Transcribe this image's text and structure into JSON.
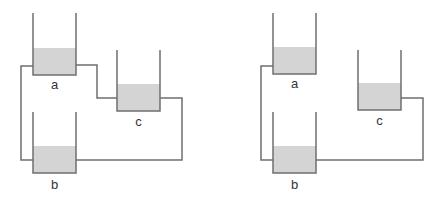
{
  "colors": {
    "line": "#6f6f6f",
    "liquid": "#d4d4d4",
    "label": "#333333",
    "background": "#ffffff"
  },
  "diagrams": [
    {
      "id": "left",
      "description": "Three containers a, b, c all interconnected by pipes",
      "containers": [
        {
          "label": "a",
          "x": 33,
          "top": 13,
          "bottom": 75,
          "width": 43,
          "fill_level": 48
        },
        {
          "label": "c",
          "x": 117,
          "top": 50,
          "bottom": 111,
          "width": 43,
          "fill_level": 84
        },
        {
          "label": "b",
          "x": 33,
          "top": 112,
          "bottom": 173,
          "width": 43,
          "fill_level": 146
        }
      ],
      "pipes": [
        {
          "from": "a",
          "to": "b"
        },
        {
          "from": "a",
          "to": "c"
        },
        {
          "from": "c",
          "to": "b"
        }
      ]
    },
    {
      "id": "right",
      "description": "Three containers a, b, c; a and c each connected to b only",
      "containers": [
        {
          "label": "a",
          "x": 273,
          "top": 13,
          "bottom": 74,
          "width": 43,
          "fill_level": 47
        },
        {
          "label": "c",
          "x": 358,
          "top": 50,
          "bottom": 110,
          "width": 43,
          "fill_level": 83
        },
        {
          "label": "b",
          "x": 273,
          "top": 112,
          "bottom": 173,
          "width": 43,
          "fill_level": 146
        }
      ],
      "pipes": [
        {
          "from": "a",
          "to": "b"
        },
        {
          "from": "c",
          "to": "b"
        }
      ]
    }
  ],
  "labels": {
    "left_a": "a",
    "left_b": "b",
    "left_c": "c",
    "right_a": "a",
    "right_b": "b",
    "right_c": "c"
  }
}
